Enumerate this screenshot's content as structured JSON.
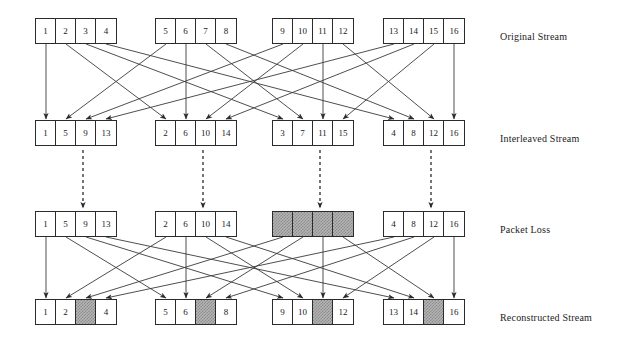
{
  "figure": {
    "background": "#ffffff",
    "line_color": "#3a3a3a",
    "box_border_color": "#2b2b2b",
    "lost_fill_color": "#b4b4b4"
  },
  "rows": [
    {
      "id": "original-stream",
      "label": "Original Stream",
      "y": 18,
      "label_x": 500,
      "label_y": 24,
      "groups": [
        {
          "x": 35,
          "cells": [
            {
              "text": "1",
              "lost": false
            },
            {
              "text": "2",
              "lost": false
            },
            {
              "text": "3",
              "lost": false
            },
            {
              "text": "4",
              "lost": false
            }
          ]
        },
        {
          "x": 155,
          "cells": [
            {
              "text": "5",
              "lost": false
            },
            {
              "text": "6",
              "lost": false
            },
            {
              "text": "7",
              "lost": false
            },
            {
              "text": "8",
              "lost": false
            }
          ]
        },
        {
          "x": 272,
          "cells": [
            {
              "text": "9",
              "lost": false
            },
            {
              "text": "10",
              "lost": false
            },
            {
              "text": "11",
              "lost": false
            },
            {
              "text": "12",
              "lost": false
            }
          ]
        },
        {
          "x": 383,
          "cells": [
            {
              "text": "13",
              "lost": false
            },
            {
              "text": "14",
              "lost": false
            },
            {
              "text": "15",
              "lost": false
            },
            {
              "text": "16",
              "lost": false
            }
          ]
        }
      ]
    },
    {
      "id": "interleaved-stream",
      "label": "Interleaved Stream",
      "y": 120,
      "label_x": 500,
      "label_y": 126,
      "groups": [
        {
          "x": 35,
          "cells": [
            {
              "text": "1",
              "lost": false
            },
            {
              "text": "5",
              "lost": false
            },
            {
              "text": "9",
              "lost": false
            },
            {
              "text": "13",
              "lost": false
            }
          ]
        },
        {
          "x": 155,
          "cells": [
            {
              "text": "2",
              "lost": false
            },
            {
              "text": "6",
              "lost": false
            },
            {
              "text": "10",
              "lost": false
            },
            {
              "text": "14",
              "lost": false
            }
          ]
        },
        {
          "x": 272,
          "cells": [
            {
              "text": "3",
              "lost": false
            },
            {
              "text": "7",
              "lost": false
            },
            {
              "text": "11",
              "lost": false
            },
            {
              "text": "15",
              "lost": false
            }
          ]
        },
        {
          "x": 383,
          "cells": [
            {
              "text": "4",
              "lost": false
            },
            {
              "text": "8",
              "lost": false
            },
            {
              "text": "12",
              "lost": false
            },
            {
              "text": "16",
              "lost": false
            }
          ]
        }
      ]
    },
    {
      "id": "packet-loss",
      "label": "Packet Loss",
      "y": 211,
      "label_x": 500,
      "label_y": 217,
      "groups": [
        {
          "x": 35,
          "cells": [
            {
              "text": "1",
              "lost": false
            },
            {
              "text": "5",
              "lost": false
            },
            {
              "text": "9",
              "lost": false
            },
            {
              "text": "13",
              "lost": false
            }
          ]
        },
        {
          "x": 155,
          "cells": [
            {
              "text": "2",
              "lost": false
            },
            {
              "text": "6",
              "lost": false
            },
            {
              "text": "10",
              "lost": false
            },
            {
              "text": "14",
              "lost": false
            }
          ]
        },
        {
          "x": 272,
          "cells": [
            {
              "text": "",
              "lost": true
            },
            {
              "text": "",
              "lost": true
            },
            {
              "text": "",
              "lost": true
            },
            {
              "text": "",
              "lost": true
            }
          ]
        },
        {
          "x": 383,
          "cells": [
            {
              "text": "4",
              "lost": false
            },
            {
              "text": "8",
              "lost": false
            },
            {
              "text": "12",
              "lost": false
            },
            {
              "text": "16",
              "lost": false
            }
          ]
        }
      ]
    },
    {
      "id": "reconstructed-stream",
      "label": "Reconstructed Stream",
      "y": 299,
      "label_x": 500,
      "label_y": 305,
      "groups": [
        {
          "x": 35,
          "cells": [
            {
              "text": "1",
              "lost": false
            },
            {
              "text": "2",
              "lost": false
            },
            {
              "text": "",
              "lost": true
            },
            {
              "text": "4",
              "lost": false
            }
          ]
        },
        {
          "x": 155,
          "cells": [
            {
              "text": "5",
              "lost": false
            },
            {
              "text": "6",
              "lost": false
            },
            {
              "text": "",
              "lost": true
            },
            {
              "text": "8",
              "lost": false
            }
          ]
        },
        {
          "x": 272,
          "cells": [
            {
              "text": "9",
              "lost": false
            },
            {
              "text": "10",
              "lost": false
            },
            {
              "text": "",
              "lost": true
            },
            {
              "text": "12",
              "lost": false
            }
          ]
        },
        {
          "x": 383,
          "cells": [
            {
              "text": "13",
              "lost": false
            },
            {
              "text": "14",
              "lost": false
            },
            {
              "text": "",
              "lost": true
            },
            {
              "text": "16",
              "lost": false
            }
          ]
        }
      ]
    }
  ],
  "dashed_arrows": {
    "description": "vertical dashed transmission arrows from interleaved stream to packet loss row",
    "from_y": 150,
    "to_y": 208,
    "x_positions": [
      83,
      203,
      320,
      431
    ]
  },
  "mapping": {
    "interleave_note": "cell n of original group g maps to cell g of interleaved group n",
    "deinterleave_note": "cell n of packet-loss group g maps to cell g of reconstructed group n"
  }
}
